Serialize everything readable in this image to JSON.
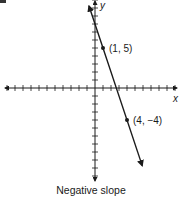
{
  "chart_data": {
    "type": "line",
    "title": "",
    "caption": "Negative slope",
    "xlabel": "x",
    "ylabel": "y",
    "xlim": [
      -11,
      10
    ],
    "ylim": [
      -11,
      11
    ],
    "grid": false,
    "tick_step": 1,
    "series": [
      {
        "name": "line",
        "slope": -3,
        "intercept": 8,
        "points": [
          {
            "x": 1,
            "y": 5,
            "label": "(1, 5)"
          },
          {
            "x": 4,
            "y": -4,
            "label": "(4, −4)"
          }
        ]
      }
    ],
    "colors": {
      "axis": "#1a1a1a",
      "line": "#1a1a1a"
    }
  }
}
